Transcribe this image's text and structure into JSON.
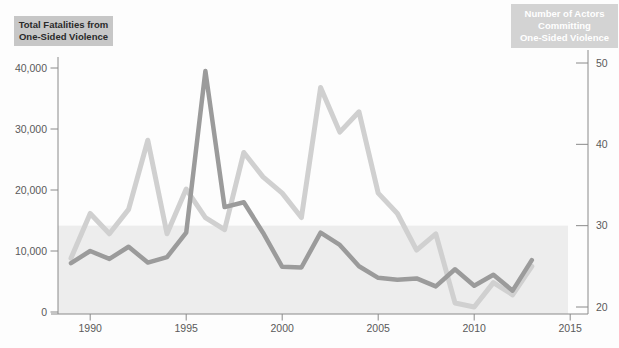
{
  "left_title": {
    "line1": "Total Fatalities from",
    "line2": "One-Sided Violence"
  },
  "right_title": {
    "line1": "Number of Actors",
    "line2": "Committing",
    "line3": "One-Sided Violence"
  },
  "colors": {
    "fatalities_line": "#9b9b9b",
    "actors_line": "#d0d0d0",
    "highlight_band": "#ededed",
    "axis": "#8a8a8a",
    "tick_text": "#5a5a5a",
    "left_box_bg": "#c7c7c7",
    "left_box_text": "#2a2a2a",
    "right_box_bg": "#d3d3d3",
    "right_box_text": "#ffffff"
  },
  "chart_data": {
    "type": "line",
    "title": "",
    "xlabel": "",
    "ylabel_left": "Total Fatalities from One-Sided Violence",
    "ylabel_right": "Number of Actors Committing One-Sided Violence",
    "x": [
      1989,
      1990,
      1991,
      1992,
      1993,
      1994,
      1995,
      1996,
      1997,
      1998,
      1999,
      2000,
      2001,
      2002,
      2003,
      2004,
      2005,
      2006,
      2007,
      2008,
      2009,
      2010,
      2011,
      2012,
      2013
    ],
    "series": [
      {
        "name": "Total Fatalities from One-Sided Violence",
        "axis": "left",
        "values": [
          8000,
          10000,
          8700,
          10700,
          8100,
          9000,
          13000,
          39500,
          17200,
          18000,
          13000,
          7400,
          7300,
          13000,
          11000,
          7500,
          5600,
          5300,
          5500,
          4200,
          7000,
          4300,
          6100,
          3500,
          8500
        ]
      },
      {
        "name": "Number of Actors Committing One-Sided Violence",
        "axis": "right",
        "values": [
          26,
          31.5,
          29,
          32,
          40.5,
          29,
          34.5,
          31,
          29.5,
          39,
          36,
          34,
          31,
          47,
          41.5,
          44,
          34,
          31.5,
          27,
          29,
          20.5,
          20,
          23,
          21.5,
          25
        ]
      }
    ],
    "left_axis": {
      "tick_values": [
        0,
        10000,
        20000,
        30000,
        40000
      ],
      "tick_labels": [
        "0",
        "10,000",
        "20,000",
        "30,000",
        "40,000"
      ],
      "range": [
        0,
        42000
      ]
    },
    "right_axis": {
      "tick_values": [
        20,
        30,
        40,
        50
      ],
      "tick_labels": [
        "20",
        "30",
        "40",
        "50"
      ],
      "range": [
        20,
        51
      ]
    },
    "x_axis": {
      "tick_values": [
        1990,
        1995,
        2000,
        2005,
        2010,
        2015
      ],
      "tick_labels": [
        "1990",
        "1995",
        "2000",
        "2005",
        "2010",
        "2015"
      ],
      "range": [
        1988.3,
        2016
      ]
    },
    "highlight_band": {
      "axis": "right",
      "below_value": 30,
      "note": "shaded region from baseline up to 30 actors"
    },
    "grid": false,
    "legend_position": "axis-title-boxes-top-corners"
  }
}
